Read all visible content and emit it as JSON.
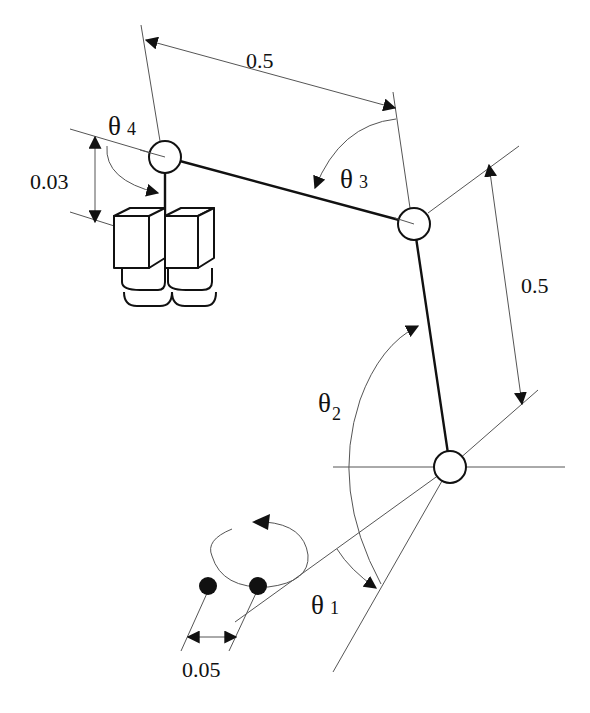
{
  "diagram": {
    "joints": [
      {
        "id": "joint-1",
        "x": 450,
        "y": 467,
        "r": 16
      },
      {
        "id": "joint-2",
        "x": 414,
        "y": 224,
        "r": 16
      },
      {
        "id": "joint-3",
        "x": 165,
        "y": 157,
        "r": 16
      }
    ],
    "links": [
      {
        "from": "joint-1",
        "to": "joint-2",
        "length_label": "0.5"
      },
      {
        "from": "joint-2",
        "to": "joint-3",
        "length_label": "0.5"
      }
    ],
    "labels": {
      "upper_link_length": "0.5",
      "lower_link_length": "0.5",
      "camera_offset": "0.03",
      "eye_separation": "0.05",
      "theta1": {
        "symbol": "θ",
        "index": "1"
      },
      "theta2": {
        "symbol": "θ",
        "index": "2"
      },
      "theta3": {
        "symbol": "θ",
        "index": "3"
      },
      "theta4": {
        "symbol": "θ",
        "index": "4"
      }
    },
    "components": {
      "camera_count": 2,
      "target_points": 2,
      "rotation_indicator": "counter-clockwise ellipse arrow"
    },
    "colors": {
      "stroke": "#111111",
      "construction_line": "#555555",
      "background": "#ffffff"
    }
  }
}
